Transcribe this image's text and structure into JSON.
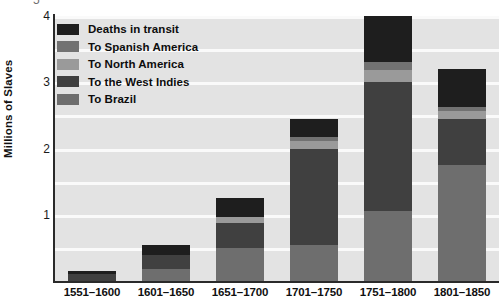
{
  "chart_data": {
    "type": "bar",
    "title": "",
    "subtype": "stacked-bar",
    "xlabel": "",
    "ylabel": "Millions of Slaves",
    "ylim": [
      0,
      4
    ],
    "yticks": [
      1,
      2,
      3,
      4
    ],
    "ytick_labels": [
      "1",
      "2",
      "3",
      "4"
    ],
    "grid": true,
    "grid_axis": "y",
    "legend_position": "upper-left-inside",
    "categories": [
      "1551–1600",
      "1601–1650",
      "1651–1700",
      "1701–1750",
      "1751–1800",
      "1801–1850"
    ],
    "series": [
      {
        "name": "To Brazil",
        "color": "#6e6e6e",
        "values": [
          0.0,
          0.18,
          0.5,
          0.55,
          1.05,
          1.75
        ]
      },
      {
        "name": "To the West Indies",
        "color": "#404040",
        "values": [
          0.1,
          0.22,
          0.38,
          1.45,
          1.95,
          0.7
        ]
      },
      {
        "name": "To North America",
        "color": "#9a9a9a",
        "values": [
          0.0,
          0.0,
          0.08,
          0.12,
          0.18,
          0.12
        ]
      },
      {
        "name": "To Spanish America",
        "color": "#727272",
        "values": [
          0.0,
          0.0,
          0.0,
          0.05,
          0.12,
          0.05
        ]
      },
      {
        "name": "Deaths in transit",
        "color": "#1e1e1e",
        "values": [
          0.05,
          0.15,
          0.29,
          0.28,
          0.7,
          0.58
        ]
      }
    ],
    "totals": [
      0.15,
      0.55,
      1.25,
      2.45,
      4.0,
      3.2
    ]
  },
  "axis": {
    "y_title": "Millions of Slaves",
    "y_ticks": [
      "4",
      "3",
      "2",
      "1"
    ],
    "clipped_top_tick": "5"
  },
  "legend": {
    "items": [
      {
        "label": "Deaths in transit",
        "color": "#1e1e1e"
      },
      {
        "label": "To Spanish America",
        "color": "#727272"
      },
      {
        "label": "To North America",
        "color": "#9a9a9a"
      },
      {
        "label": "To the West Indies",
        "color": "#404040"
      },
      {
        "label": "To Brazil",
        "color": "#6e6e6e"
      }
    ]
  },
  "colors": {
    "plot_background": "#e3e3e3",
    "gridline": "#fafafa",
    "axis": "#2a2a2a",
    "page_background": "#ffffff"
  }
}
